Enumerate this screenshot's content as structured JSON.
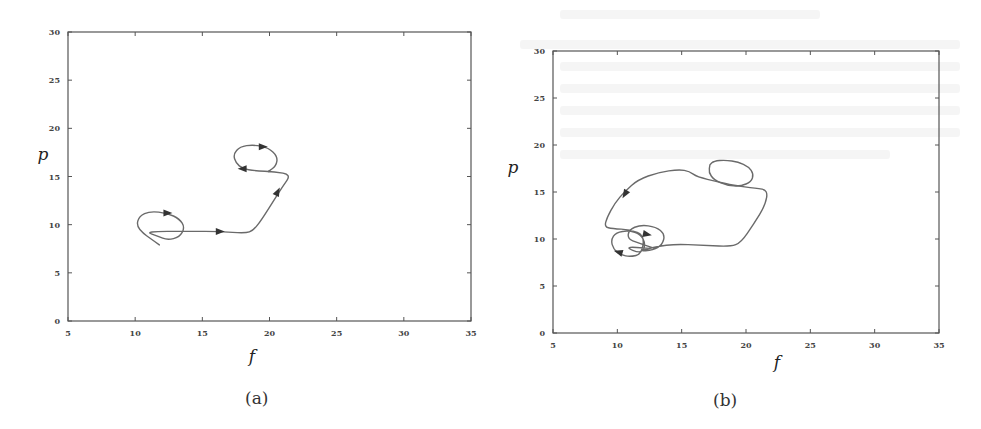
{
  "figure": {
    "captions": [
      "(a)",
      "(b)"
    ]
  },
  "chart_data": [
    {
      "type": "line",
      "panel": "(a)",
      "title": "",
      "xlabel": "f",
      "ylabel": "p",
      "xlim": [
        5,
        35
      ],
      "ylim": [
        0,
        30
      ],
      "xticks": [
        5,
        10,
        15,
        20,
        25,
        30,
        35
      ],
      "yticks": [
        0,
        5,
        10,
        15,
        20,
        25,
        30
      ],
      "xtick_labels": [
        "5",
        "10",
        "15",
        "20",
        "25",
        "30",
        "35"
      ],
      "ytick_labels": [
        "0",
        "5",
        "10",
        "15",
        "20",
        "25",
        "30"
      ],
      "grid": false,
      "legend": null,
      "frame_px": {
        "left": 68,
        "right": 471,
        "top": 32,
        "bottom": 321
      },
      "series": [
        {
          "name": "trajectory",
          "points": [
            [
              11.8,
              7.9
            ],
            [
              11.1,
              8.6
            ],
            [
              10.6,
              9.1
            ],
            [
              10.1,
              9.9
            ],
            [
              10.3,
              10.9
            ],
            [
              11.1,
              11.4
            ],
            [
              12.4,
              11.2
            ],
            [
              13.3,
              10.6
            ],
            [
              13.7,
              9.7
            ],
            [
              13.3,
              8.7
            ],
            [
              12.4,
              8.4
            ],
            [
              11.7,
              8.8
            ],
            [
              10.7,
              9.3
            ],
            [
              14.1,
              9.3
            ],
            [
              16.3,
              9.3
            ],
            [
              18.2,
              9.1
            ],
            [
              18.8,
              9.4
            ],
            [
              19.4,
              10.5
            ],
            [
              20.4,
              12.7
            ],
            [
              21.0,
              14.0
            ],
            [
              21.6,
              15.2
            ],
            [
              20.4,
              15.5
            ],
            [
              18.9,
              15.6
            ],
            [
              18.0,
              15.8
            ],
            [
              17.5,
              16.4
            ],
            [
              17.3,
              17.3
            ],
            [
              17.8,
              18.1
            ],
            [
              18.8,
              18.3
            ],
            [
              19.9,
              18.0
            ],
            [
              20.6,
              17.1
            ],
            [
              20.5,
              16.1
            ],
            [
              19.9,
              15.5
            ]
          ]
        }
      ],
      "arrows": [
        {
          "at": [
            12.4,
            11.2
          ],
          "dir": [
            1,
            0
          ]
        },
        {
          "at": [
            16.3,
            9.3
          ],
          "dir": [
            1,
            0
          ]
        },
        {
          "at": [
            20.6,
            13.4
          ],
          "dir": [
            0.5,
            1
          ]
        },
        {
          "at": [
            19.5,
            18.1
          ],
          "dir": [
            1,
            0
          ]
        },
        {
          "at": [
            18.0,
            15.8
          ],
          "dir": [
            -1,
            0
          ]
        }
      ],
      "axis_label_px": {
        "x": [
          252,
          362
        ],
        "y": [
          43,
          160
        ]
      }
    },
    {
      "type": "line",
      "panel": "(b)",
      "title": "",
      "xlabel": "f",
      "ylabel": "p",
      "xlim": [
        5,
        35
      ],
      "ylim": [
        0,
        30
      ],
      "xticks": [
        5,
        10,
        15,
        20,
        25,
        30,
        35
      ],
      "yticks": [
        0,
        5,
        10,
        15,
        20,
        25,
        30
      ],
      "xtick_labels": [
        "5",
        "10",
        "15",
        "20",
        "25",
        "30",
        "35"
      ],
      "ytick_labels": [
        "0",
        "5",
        "10",
        "15",
        "20",
        "25",
        "30"
      ],
      "grid": false,
      "legend": null,
      "frame_px": {
        "left": 553,
        "right": 939,
        "top": 51,
        "bottom": 333
      },
      "series": [
        {
          "name": "trajectory",
          "points": [
            [
              12.9,
              9.0
            ],
            [
              11.6,
              9.6
            ],
            [
              10.8,
              10.0
            ],
            [
              10.9,
              11.0
            ],
            [
              11.8,
              11.5
            ],
            [
              13.0,
              11.3
            ],
            [
              13.7,
              10.5
            ],
            [
              13.5,
              9.4
            ],
            [
              12.8,
              8.8
            ],
            [
              11.6,
              8.7
            ],
            [
              14.0,
              9.5
            ],
            [
              17.0,
              9.3
            ],
            [
              18.8,
              9.2
            ],
            [
              19.6,
              9.6
            ],
            [
              20.6,
              11.6
            ],
            [
              21.5,
              13.6
            ],
            [
              21.7,
              15.2
            ],
            [
              20.8,
              15.4
            ],
            [
              19.0,
              15.7
            ],
            [
              17.8,
              16.1
            ],
            [
              16.2,
              16.6
            ],
            [
              15.6,
              17.2
            ],
            [
              14.8,
              17.4
            ],
            [
              13.2,
              17.1
            ],
            [
              11.6,
              16.3
            ],
            [
              10.6,
              15.1
            ],
            [
              9.8,
              13.8
            ],
            [
              9.2,
              12.3
            ],
            [
              9.0,
              11.3
            ],
            [
              9.6,
              11.1
            ],
            [
              11.0,
              11.0
            ],
            [
              12.1,
              10.4
            ],
            [
              11.9,
              8.4
            ],
            [
              11.0,
              8.1
            ],
            [
              10.3,
              8.3
            ],
            [
              9.7,
              8.9
            ],
            [
              9.5,
              9.9
            ],
            [
              9.9,
              10.7
            ],
            [
              10.9,
              10.9
            ],
            [
              11.8,
              10.5
            ],
            [
              12.2,
              9.5
            ],
            [
              11.9,
              8.4
            ],
            [
              10.5,
              9.2
            ],
            [
              12.5,
              9.0
            ]
          ]
        },
        {
          "name": "upper-loop",
          "points": [
            [
              17.2,
              17.9
            ],
            [
              17.5,
              18.3
            ],
            [
              18.4,
              18.4
            ],
            [
              19.4,
              18.2
            ],
            [
              20.2,
              17.7
            ],
            [
              20.6,
              16.9
            ],
            [
              20.4,
              16.1
            ],
            [
              19.6,
              15.6
            ],
            [
              18.5,
              15.7
            ],
            [
              17.5,
              16.3
            ],
            [
              17.1,
              17.1
            ],
            [
              17.2,
              17.9
            ]
          ]
        }
      ],
      "arrows": [
        {
          "at": [
            10.6,
            14.8
          ],
          "dir": [
            -0.6,
            -1
          ]
        },
        {
          "at": [
            12.3,
            10.5
          ],
          "dir": [
            1,
            -0.2
          ]
        },
        {
          "at": [
            10.1,
            8.6
          ],
          "dir": [
            -1,
            0.3
          ]
        }
      ],
      "axis_label_px": {
        "x": [
          777,
          368
        ],
        "y": [
          513,
          173
        ]
      }
    }
  ]
}
